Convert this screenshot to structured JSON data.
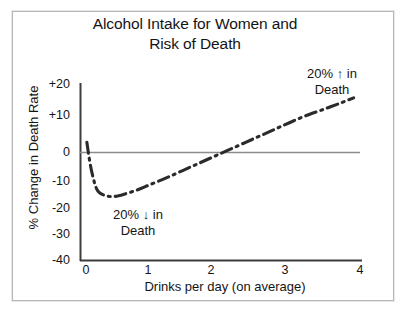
{
  "chart_data": {
    "type": "line",
    "title": "Alcohol Intake for Women and Risk of Death",
    "title_lines": [
      "Alcohol Intake for Women and",
      "Risk of Death"
    ],
    "xlabel": "Drinks per day (on average)",
    "ylabel": "% Change in Death Rate",
    "xlim": [
      -0.1,
      4.3
    ],
    "ylim": [
      -40,
      20
    ],
    "xticks": [
      "0",
      "1",
      "2",
      "3",
      "4"
    ],
    "xtick_values": [
      0,
      1,
      2,
      3,
      4
    ],
    "yticks": [
      "+20",
      "+10",
      "0",
      "-10",
      "-20",
      "-30",
      "-40"
    ],
    "ytick_values": [
      20,
      10,
      0,
      -10,
      -20,
      -30,
      -40
    ],
    "grid": false,
    "legend": "none",
    "line_style": "dash-dot",
    "line_color": "#2b2b2b",
    "zero_line_color": "#8c8c8c",
    "axis_color": "#3d3d3d",
    "series": [
      {
        "name": "% Change in Death Rate",
        "x": [
          0.0,
          0.05,
          0.1,
          0.15,
          0.2,
          0.3,
          0.4,
          0.5,
          0.6,
          0.8,
          1.0,
          1.25,
          1.5,
          1.75,
          2.0,
          2.25,
          2.5,
          2.75,
          3.0,
          3.25,
          3.5,
          3.75,
          4.0,
          4.2
        ],
        "values": [
          0,
          -7,
          -12,
          -15.5,
          -17,
          -18,
          -18.3,
          -18,
          -17.4,
          -16,
          -14.2,
          -12,
          -9.6,
          -7.2,
          -4.8,
          -2.4,
          0,
          2.4,
          4.8,
          7.2,
          9.4,
          11.3,
          13.3,
          15
        ]
      }
    ],
    "annotations": [
      {
        "id": "increase",
        "text": "20% ↑ in Death",
        "lines": [
          "20% ↑ in",
          "Death"
        ],
        "value": 20,
        "direction": "up"
      },
      {
        "id": "decrease",
        "text": "20% ↓ in Death",
        "lines": [
          "20% ↓ in",
          "Death"
        ],
        "value": 20,
        "direction": "down"
      }
    ]
  }
}
